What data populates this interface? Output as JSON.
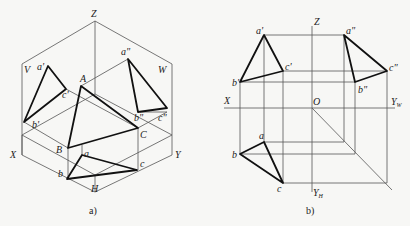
{
  "figure_a": {
    "caption": "a)",
    "labels": {
      "Z": "Z",
      "V": "V",
      "W": "W",
      "X": "X",
      "Y": "Y",
      "H": "H",
      "A": "A",
      "B": "B",
      "C": "C",
      "a_prime": "a'",
      "b_prime": "b'",
      "c_prime": "c'",
      "a_dprime": "a\"",
      "b_dprime": "b\"",
      "c_dprime": "c\"",
      "a": "a",
      "b": "b",
      "c": "c"
    }
  },
  "figure_b": {
    "caption": "b)",
    "labels": {
      "Z": "Z",
      "X": "X",
      "O": "O",
      "Y": "Y",
      "YW_sub": "W",
      "YH_sub": "H",
      "a_prime": "a'",
      "b_prime": "b'",
      "c_prime": "c'",
      "a_dprime": "a\"",
      "b_dprime": "b\"",
      "c_dprime": "c\"",
      "a": "a",
      "b": "b",
      "c": "c"
    }
  },
  "colors": {
    "background": "#f7f7f5",
    "line": "#111111",
    "construction": "#555555"
  }
}
